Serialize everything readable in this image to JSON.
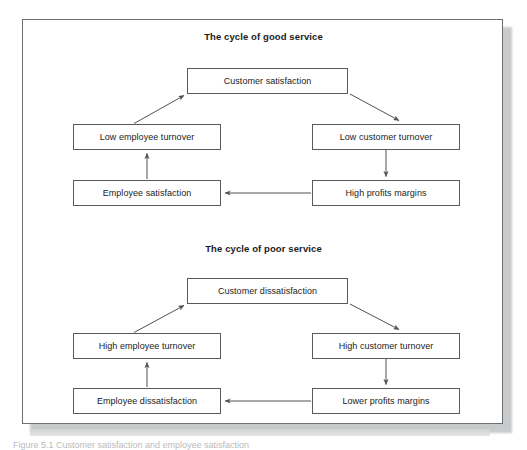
{
  "figure": {
    "caption": "Figure 5.1  Customer satisfaction and employee satisfaction",
    "border_color": "#575b5e",
    "text_color": "#1b1b1b"
  },
  "cycles": [
    {
      "id": "good-service",
      "title": "The cycle of good service",
      "nodes": {
        "top": "Customer satisfaction",
        "left_upper": "Low employee turnover",
        "right_upper": "Low customer turnover",
        "left_lower": "Employee satisfaction",
        "right_lower": "High profits margins"
      }
    },
    {
      "id": "poor-service",
      "title": "The cycle of poor service",
      "nodes": {
        "top": "Customer dissatisfaction",
        "left_upper": "High employee turnover",
        "right_upper": "High customer turnover",
        "left_lower": "Employee dissatisfaction",
        "right_lower": "Lower profits margins"
      }
    }
  ]
}
